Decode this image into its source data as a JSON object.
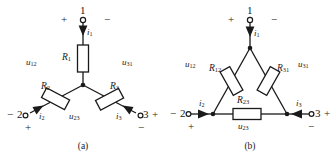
{
  "figure": {
    "panels": [
      {
        "id": "a",
        "caption": "(a)",
        "type": "wye-star-connection",
        "terminals": [
          {
            "name": "terminal-1",
            "label": "1",
            "sign_left": "+",
            "sign_right": "−"
          },
          {
            "name": "terminal-2",
            "label": "2",
            "sign_left": "−",
            "sign_below": "+"
          },
          {
            "name": "terminal-3",
            "label": "3",
            "sign_right": "+",
            "sign_below": "−"
          }
        ],
        "resistors": [
          {
            "name": "resistor-r1",
            "symbol": "R",
            "subscript": "1"
          },
          {
            "name": "resistor-r2",
            "symbol": "R",
            "subscript": "2"
          },
          {
            "name": "resistor-r3",
            "symbol": "R",
            "subscript": "3"
          }
        ],
        "currents": [
          {
            "name": "current-i1",
            "symbol": "i",
            "subscript": "1"
          },
          {
            "name": "current-i2",
            "symbol": "i",
            "subscript": "2"
          },
          {
            "name": "current-i3",
            "symbol": "i",
            "subscript": "3"
          }
        ],
        "voltages": [
          {
            "name": "voltage-u12",
            "symbol": "u",
            "subscript": "12"
          },
          {
            "name": "voltage-u31",
            "symbol": "u",
            "subscript": "31"
          },
          {
            "name": "voltage-u23",
            "symbol": "u",
            "subscript": "23"
          }
        ]
      },
      {
        "id": "b",
        "caption": "(b)",
        "type": "delta-triangle-connection",
        "terminals": [
          {
            "name": "terminal-1",
            "label": "1",
            "sign_left": "+",
            "sign_right": "−"
          },
          {
            "name": "terminal-2",
            "label": "2",
            "sign_left": "−",
            "sign_below": "+"
          },
          {
            "name": "terminal-3",
            "label": "3",
            "sign_right": "+",
            "sign_below": "−"
          }
        ],
        "resistors": [
          {
            "name": "resistor-r12",
            "symbol": "R",
            "subscript": "12"
          },
          {
            "name": "resistor-r31",
            "symbol": "R",
            "subscript": "31"
          },
          {
            "name": "resistor-r23",
            "symbol": "R",
            "subscript": "23"
          }
        ],
        "currents": [
          {
            "name": "current-i1",
            "symbol": "i",
            "subscript": "1"
          },
          {
            "name": "current-i2",
            "symbol": "i",
            "subscript": "2"
          },
          {
            "name": "current-i3",
            "symbol": "i",
            "subscript": "3"
          }
        ],
        "voltages": [
          {
            "name": "voltage-u12",
            "symbol": "u",
            "subscript": "12"
          },
          {
            "name": "voltage-u31",
            "symbol": "u",
            "subscript": "31"
          },
          {
            "name": "voltage-u23",
            "symbol": "u",
            "subscript": "23"
          }
        ]
      }
    ],
    "colors": {
      "line": "#1a1a1a",
      "text": "#1a1a1a",
      "background": "#ffffff"
    }
  }
}
